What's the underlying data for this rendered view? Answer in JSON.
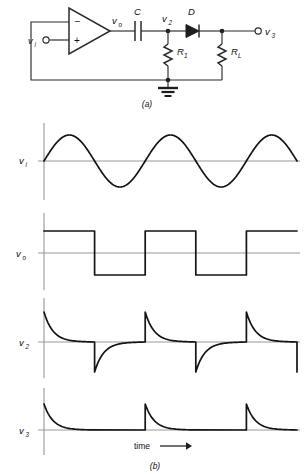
{
  "figure": {
    "caption_a": "(a)",
    "caption_b": "(b)"
  },
  "circuit": {
    "name": "op-amp comparator differentiator peak clipper",
    "labels": {
      "input_node": "v",
      "input_node_sub": "i",
      "opamp_minus": "−",
      "opamp_plus": "+",
      "opamp_output": "v",
      "opamp_output_sub": "o",
      "capacitor": "C",
      "node2": "v",
      "node2_sub": "2",
      "diode": "D",
      "resistor1": "R",
      "resistor1_sub": "1",
      "resistor_load": "R",
      "resistor_load_sub": "L",
      "output_node": "v",
      "output_node_sub": "3",
      "ground": "ground-symbol"
    }
  },
  "waveforms": {
    "axis_label_time": "time",
    "time_arrow": "⟶",
    "plots": [
      {
        "id": "vi",
        "label": "v",
        "label_sub": "i",
        "type": "sine",
        "description": "sinusoidal input, 2.5 cycles, zero mean",
        "cycles": 2.5,
        "amplitude": 26,
        "phase_deg": 0
      },
      {
        "id": "vo",
        "label": "v",
        "label_sub": "o",
        "type": "square",
        "description": "comparator square wave output, high first",
        "cycles": 2.5,
        "amplitude": 22,
        "duty": 0.5
      },
      {
        "id": "v2",
        "label": "v",
        "label_sub": "2",
        "type": "bipolar-spikes",
        "description": "RC differentiated spikes, alternating positive and negative exponential decays",
        "positive_spike_amplitude": 30,
        "negative_spike_amplitude": 30,
        "spike_count": 5,
        "decay_tau": 9
      },
      {
        "id": "v3",
        "label": "v",
        "label_sub": "3",
        "type": "positive-spikes",
        "description": "diode rectified positive spikes only",
        "positive_spike_amplitude": 26,
        "spike_count": 3,
        "decay_tau": 9
      }
    ]
  },
  "colors": {
    "trace": "#141414",
    "axis": "#9a9a9a",
    "wire": "#2b2b2b",
    "background": "#ffffff"
  }
}
